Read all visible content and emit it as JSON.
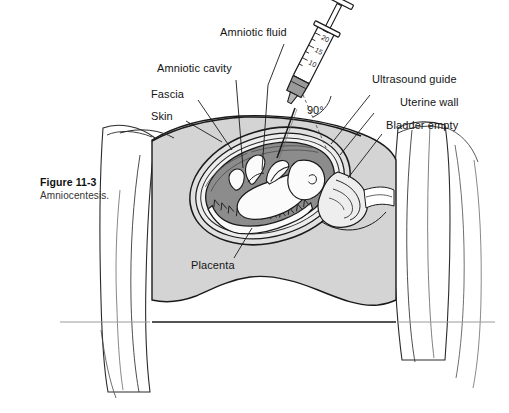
{
  "figure": {
    "number": "Figure 11-3",
    "caption": "Amniocentesis.",
    "background_color": "#ffffff"
  },
  "labels": {
    "amniotic_fluid": "Amniotic fluid",
    "amniotic_cavity": "Amniotic cavity",
    "fascia": "Fascia",
    "skin": "Skin",
    "ultrasound_guide": "Ultrasound guide",
    "uterine_wall": "Uterine wall",
    "bladder_empty": "Bladder empty",
    "placenta": "Placenta",
    "angle": "90°"
  },
  "syringe": {
    "graduation_20": "20",
    "graduation_15": "15",
    "graduation_10": "10"
  },
  "colors": {
    "line": "#1a1a1a",
    "abdomen_fill": "#d4d4d4",
    "amniotic_fluid_fill": "#8c8c8c",
    "fetus_fill": "#fbfbfb",
    "uterine_wall_fill": "#e8e8e8",
    "drape_fill": "#ffffff",
    "syringe_hub": "#9a9a9a",
    "text": "#141414"
  }
}
